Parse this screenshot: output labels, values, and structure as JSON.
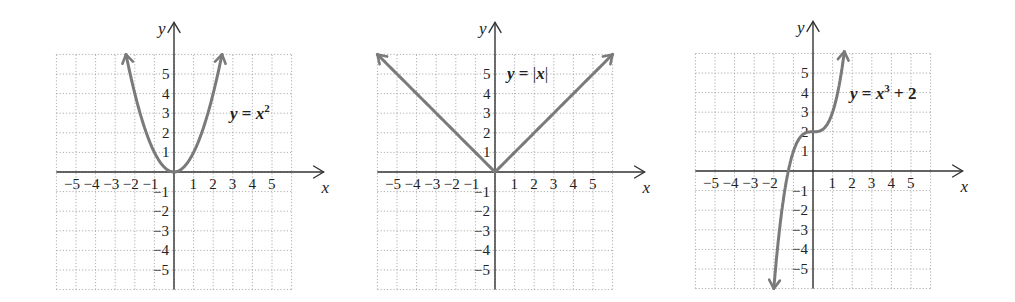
{
  "chart_data": [
    {
      "type": "line",
      "title": "y = x^2",
      "equation_label": {
        "lhs": "y",
        "rhs_base": "x",
        "rhs_exp": "2",
        "rhs_tail": ""
      },
      "xlabel": "x",
      "ylabel": "y",
      "xlim": [
        -6,
        6
      ],
      "ylim": [
        -6,
        6
      ],
      "grid": true,
      "x_ticks": [
        -5,
        -4,
        -3,
        -2,
        -1,
        1,
        2,
        3,
        4,
        5
      ],
      "y_ticks": [
        5,
        4,
        3,
        2,
        1,
        -1,
        -2,
        -3,
        -4,
        -5
      ],
      "function": "x^2",
      "domain": [
        -2.45,
        2.45
      ],
      "points": [
        [
          -2,
          4
        ],
        [
          -1,
          1
        ],
        [
          0,
          0
        ],
        [
          1,
          1
        ],
        [
          2,
          4
        ]
      ],
      "arrows": "both-ends"
    },
    {
      "type": "line",
      "title": "y = |x|",
      "equation_label": {
        "lhs": "y",
        "rhs_abs": "x"
      },
      "xlabel": "x",
      "ylabel": "y",
      "xlim": [
        -6,
        6
      ],
      "ylim": [
        -6,
        6
      ],
      "grid": true,
      "x_ticks": [
        -5,
        -4,
        -3,
        -2,
        -1,
        1,
        2,
        3,
        4,
        5
      ],
      "y_ticks": [
        5,
        4,
        3,
        2,
        1,
        -1,
        -2,
        -3,
        -4,
        -5
      ],
      "function": "abs(x)",
      "domain": [
        -6,
        6
      ],
      "points": [
        [
          -6,
          6
        ],
        [
          -3,
          3
        ],
        [
          0,
          0
        ],
        [
          3,
          3
        ],
        [
          6,
          6
        ]
      ],
      "arrows": "both-ends"
    },
    {
      "type": "line",
      "title": "y = x^3 + 2",
      "equation_label": {
        "lhs": "y",
        "rhs_base": "x",
        "rhs_exp": "3",
        "rhs_tail": " + 2"
      },
      "xlabel": "x",
      "ylabel": "y",
      "xlim": [
        -6,
        6
      ],
      "ylim": [
        -6,
        6
      ],
      "grid": true,
      "x_ticks": [
        -5,
        -4,
        -3,
        -2,
        1,
        2,
        3,
        4,
        5
      ],
      "y_ticks": [
        5,
        4,
        3,
        2,
        1,
        -1,
        -2,
        -3,
        -4,
        -5
      ],
      "function": "x^3 + 2",
      "domain": [
        -2.0,
        1.6
      ],
      "points": [
        [
          -2,
          -6
        ],
        [
          -1.26,
          0
        ],
        [
          -1,
          1
        ],
        [
          0,
          2
        ],
        [
          1,
          3
        ],
        [
          1.59,
          6
        ]
      ],
      "arrows": "both-ends"
    }
  ]
}
